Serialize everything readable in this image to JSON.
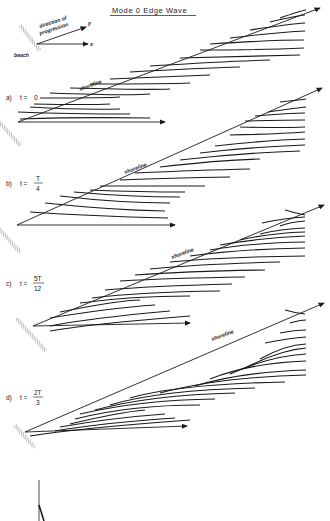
{
  "title": "Mode 0   Edge Wave",
  "legend": {
    "direction": "direction of",
    "progression": "progression",
    "y_axis": "y",
    "x_axis": "x",
    "beach": "beach"
  },
  "panels": [
    {
      "id": "a",
      "label": "a)",
      "time_prefix": "t =",
      "time_value": "0",
      "shoreline": "shoreline",
      "origin": [
        18,
        148
      ],
      "crest_count": 15
    },
    {
      "id": "b",
      "label": "b)",
      "time_prefix": "t =",
      "num": "T",
      "den": "4",
      "shoreline": "shoreline",
      "origin": [
        18,
        275
      ],
      "crest_count": 14
    },
    {
      "id": "c",
      "label": "c)",
      "time_prefix": "t =",
      "num": "5T",
      "den": "12",
      "shoreline": "shoreline",
      "origin": [
        32,
        386
      ],
      "crest_count": 13
    },
    {
      "id": "d",
      "label": "d)",
      "time_prefix": "t =",
      "num": "2T",
      "den": "3",
      "shoreline": "shoreline",
      "origin": [
        32,
        432
      ],
      "crest_count": 14
    }
  ],
  "colors": {
    "ink": "#1a1a1a",
    "hatch": "#555555",
    "background": "#ffffff"
  }
}
